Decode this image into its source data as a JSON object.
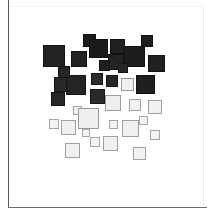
{
  "figure": {
    "title": "",
    "background_color": "#ffffff",
    "frame_color": "#5a5a5a",
    "width": 215,
    "height": 218
  },
  "chart_data": {
    "type": "scatter",
    "title": "",
    "subtitle": "",
    "xlabel": "",
    "ylabel": "",
    "xlim": [
      0,
      215
    ],
    "ylim": [
      0,
      218
    ],
    "grid": false,
    "legend": null,
    "marker": "square",
    "colormap": "grayscale-vertical",
    "n_points": 36,
    "points": [
      {
        "id": 1,
        "x": 89,
        "y": 40,
        "size": 13,
        "fill": "#1c1c1c",
        "edge": "#111111"
      },
      {
        "id": 2,
        "x": 147,
        "y": 41,
        "size": 12,
        "fill": "#1e1e1e",
        "edge": "#111111"
      },
      {
        "id": 3,
        "x": 117,
        "y": 46,
        "size": 15,
        "fill": "#202020",
        "edge": "#111111"
      },
      {
        "id": 4,
        "x": 98,
        "y": 48,
        "size": 19,
        "fill": "#1a1a1a",
        "edge": "#111111"
      },
      {
        "id": 5,
        "x": 54,
        "y": 56,
        "size": 22,
        "fill": "#232323",
        "edge": "#141414"
      },
      {
        "id": 6,
        "x": 134,
        "y": 56,
        "size": 21,
        "fill": "#1d1d1d",
        "edge": "#111111"
      },
      {
        "id": 7,
        "x": 79,
        "y": 59,
        "size": 16,
        "fill": "#222222",
        "edge": "#121212"
      },
      {
        "id": 8,
        "x": 116,
        "y": 62,
        "size": 16,
        "fill": "#242424",
        "edge": "#131313"
      },
      {
        "id": 9,
        "x": 156,
        "y": 63,
        "size": 17,
        "fill": "#202020",
        "edge": "#121212"
      },
      {
        "id": 10,
        "x": 97,
        "y": 79,
        "size": 12,
        "fill": "#2b2b2b",
        "edge": "#161616"
      },
      {
        "id": 11,
        "x": 112,
        "y": 81,
        "size": 12,
        "fill": "#262626",
        "edge": "#141414"
      },
      {
        "id": 12,
        "x": 61,
        "y": 84,
        "size": 15,
        "fill": "#282828",
        "edge": "#151515"
      },
      {
        "id": 13,
        "x": 76,
        "y": 85,
        "size": 20,
        "fill": "#242424",
        "edge": "#131313"
      },
      {
        "id": 14,
        "x": 145,
        "y": 84,
        "size": 19,
        "fill": "#1f1f1f",
        "edge": "#121212"
      },
      {
        "id": 15,
        "x": 127,
        "y": 84,
        "size": 13,
        "fill": "#f0f0f0",
        "edge": "#9a9a9a"
      },
      {
        "id": 16,
        "x": 97,
        "y": 96,
        "size": 15,
        "fill": "#2a2a2a",
        "edge": "#161616"
      },
      {
        "id": 17,
        "x": 58,
        "y": 99,
        "size": 14,
        "fill": "#262626",
        "edge": "#141414"
      },
      {
        "id": 18,
        "x": 113,
        "y": 103,
        "size": 16,
        "fill": "#eeeeee",
        "edge": "#9c9c9c"
      },
      {
        "id": 19,
        "x": 135,
        "y": 105,
        "size": 12,
        "fill": "#f1f1f1",
        "edge": "#a2a2a2"
      },
      {
        "id": 20,
        "x": 155,
        "y": 107,
        "size": 14,
        "fill": "#f1f1f1",
        "edge": "#a0a0a0"
      },
      {
        "id": 21,
        "x": 77,
        "y": 110,
        "size": 9,
        "fill": "#f2f2f2",
        "edge": "#a4a4a4"
      },
      {
        "id": 22,
        "x": 88,
        "y": 118,
        "size": 21,
        "fill": "#efefef",
        "edge": "#9a9a9a"
      },
      {
        "id": 23,
        "x": 113,
        "y": 124,
        "size": 9,
        "fill": "#f2f2f2",
        "edge": "#a5a5a5"
      },
      {
        "id": 24,
        "x": 54,
        "y": 124,
        "size": 10,
        "fill": "#f3f3f3",
        "edge": "#a6a6a6"
      },
      {
        "id": 25,
        "x": 68,
        "y": 127,
        "size": 15,
        "fill": "#f1f1f1",
        "edge": "#a0a0a0"
      },
      {
        "id": 26,
        "x": 130,
        "y": 128,
        "size": 17,
        "fill": "#f0f0f0",
        "edge": "#9e9e9e"
      },
      {
        "id": 27,
        "x": 155,
        "y": 135,
        "size": 10,
        "fill": "#f2f2f2",
        "edge": "#a4a4a4"
      },
      {
        "id": 28,
        "x": 95,
        "y": 142,
        "size": 10,
        "fill": "#f3f3f3",
        "edge": "#a6a6a6"
      },
      {
        "id": 29,
        "x": 110,
        "y": 143,
        "size": 15,
        "fill": "#f1f1f1",
        "edge": "#a1a1a1"
      },
      {
        "id": 30,
        "x": 72,
        "y": 150,
        "size": 15,
        "fill": "#f1f1f1",
        "edge": "#a0a0a0"
      },
      {
        "id": 31,
        "x": 139,
        "y": 153,
        "size": 13,
        "fill": "#f2f2f2",
        "edge": "#a3a3a3"
      },
      {
        "id": 32,
        "x": 123,
        "y": 68,
        "size": 10,
        "fill": "#272727",
        "edge": "#151515"
      },
      {
        "id": 33,
        "x": 64,
        "y": 72,
        "size": 12,
        "fill": "#252525",
        "edge": "#141414"
      },
      {
        "id": 34,
        "x": 104,
        "y": 65,
        "size": 11,
        "fill": "#1f1f1f",
        "edge": "#121212"
      },
      {
        "id": 35,
        "x": 143,
        "y": 120,
        "size": 9,
        "fill": "#f3f3f3",
        "edge": "#a7a7a7"
      },
      {
        "id": 36,
        "x": 86,
        "y": 133,
        "size": 8,
        "fill": "#f3f3f3",
        "edge": "#a8a8a8"
      }
    ]
  }
}
